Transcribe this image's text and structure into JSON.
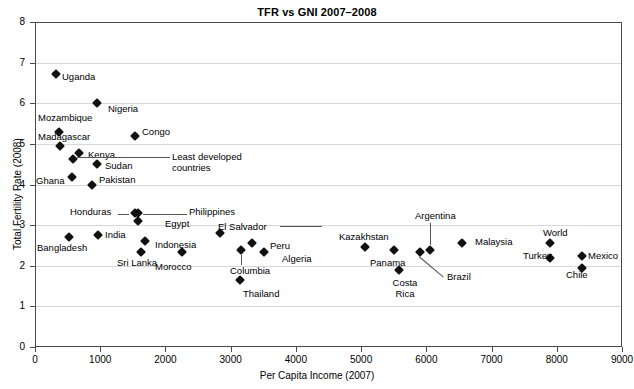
{
  "chart_data": {
    "type": "scatter",
    "title": "TFR vs GNI 2007–2008",
    "xlabel": "Per Capita Income (2007)",
    "ylabel": "Total Fertility Rate (2008)",
    "xlim": [
      0,
      9000
    ],
    "ylim": [
      0,
      8
    ],
    "xticks": [
      "0",
      "1000",
      "2000",
      "3000",
      "4000",
      "5000",
      "6000",
      "7000",
      "8000",
      "9000"
    ],
    "yticks": [
      "0",
      "1",
      "2",
      "3",
      "4",
      "5",
      "6",
      "7",
      "8"
    ],
    "grid": true,
    "legend": "none",
    "marker": "diamond",
    "marker_color": "#111111",
    "points": [
      {
        "label": "Uganda",
        "x": 320,
        "y": 6.72,
        "lx": 62,
        "ly": 72,
        "align": "right"
      },
      {
        "label": "Nigeria",
        "x": 950,
        "y": 6.0,
        "lx": 108,
        "ly": 104,
        "align": "right"
      },
      {
        "label": "Mozambique",
        "x": 370,
        "y": 5.3,
        "lx": 38,
        "ly": 113,
        "align": "above"
      },
      {
        "label": "Congo",
        "x": 1540,
        "y": 5.2,
        "lx": 142,
        "ly": 127,
        "align": "right"
      },
      {
        "label": "Madagascar",
        "x": 380,
        "y": 4.95,
        "lx": 38,
        "ly": 132,
        "align": "above"
      },
      {
        "label": "Kenya",
        "x": 680,
        "y": 4.78,
        "lx": 88,
        "ly": 150,
        "align": "right"
      },
      {
        "label": "",
        "x": 590,
        "y": 4.62,
        "lx": 0,
        "ly": 0,
        "align": "none"
      },
      {
        "label": "Sudan",
        "x": 950,
        "y": 4.5,
        "lx": 105,
        "ly": 161,
        "align": "right"
      },
      {
        "label": "Ghana",
        "x": 570,
        "y": 4.18,
        "lx": 36,
        "ly": 176,
        "align": "left"
      },
      {
        "label": "Pakistan",
        "x": 870,
        "y": 4.0,
        "lx": 99,
        "ly": 175,
        "align": "right"
      },
      {
        "label": "Philippines",
        "x": 1580,
        "y": 3.3,
        "lx": 189,
        "ly": 207,
        "align": "right-leader"
      },
      {
        "label": "Honduras",
        "x": 1530,
        "y": 3.3,
        "lx": 70,
        "ly": 207,
        "align": "left-leader"
      },
      {
        "label": "Egypt",
        "x": 1580,
        "y": 3.1,
        "lx": 165,
        "ly": 219,
        "align": "right"
      },
      {
        "label": "India",
        "x": 970,
        "y": 2.75,
        "lx": 105,
        "ly": 230,
        "align": "right"
      },
      {
        "label": "Bangladesh",
        "x": 520,
        "y": 2.7,
        "lx": 37,
        "ly": 243,
        "align": "below"
      },
      {
        "label": "Indonesia",
        "x": 1690,
        "y": 2.6,
        "lx": 155,
        "ly": 240,
        "align": "right"
      },
      {
        "label": "El Salvador",
        "x": 2840,
        "y": 2.8,
        "lx": 218,
        "ly": 222,
        "align": "above-leader"
      },
      {
        "label": "Sri Lanka",
        "x": 1620,
        "y": 2.35,
        "lx": 117,
        "ly": 258,
        "align": "below"
      },
      {
        "label": "Morocco",
        "x": 2250,
        "y": 2.35,
        "lx": 155,
        "ly": 262,
        "align": "below"
      },
      {
        "label": "Peru",
        "x": 3320,
        "y": 2.55,
        "lx": 270,
        "ly": 241,
        "align": "right"
      },
      {
        "label": "Algeria",
        "x": 3510,
        "y": 2.35,
        "lx": 282,
        "ly": 254,
        "align": "right"
      },
      {
        "label": "Columbia",
        "x": 3160,
        "y": 2.4,
        "lx": 230,
        "ly": 266,
        "align": "below-leader"
      },
      {
        "label": "Thailand",
        "x": 3140,
        "y": 1.65,
        "lx": 243,
        "ly": 289,
        "align": "below"
      },
      {
        "label": "Kazakhstan",
        "x": 5060,
        "y": 2.45,
        "lx": 339,
        "ly": 232,
        "align": "above"
      },
      {
        "label": "Panama",
        "x": 5510,
        "y": 2.4,
        "lx": 370,
        "ly": 258,
        "align": "below"
      },
      {
        "label": "Costa Rica",
        "x": 5580,
        "y": 1.9,
        "lx": 383,
        "ly": 278,
        "align": "below-two"
      },
      {
        "label": "Brazil",
        "x": 5900,
        "y": 2.35,
        "lx": 447,
        "ly": 272,
        "align": "diag-leader"
      },
      {
        "label": "Argentina",
        "x": 6060,
        "y": 2.4,
        "lx": 415,
        "ly": 211,
        "align": "above-leader"
      },
      {
        "label": "Malaysia",
        "x": 6540,
        "y": 2.55,
        "lx": 475,
        "ly": 237,
        "align": "right"
      },
      {
        "label": "World",
        "x": 7900,
        "y": 2.55,
        "lx": 543,
        "ly": 228,
        "align": "above"
      },
      {
        "label": "Turkey",
        "x": 7900,
        "y": 2.2,
        "lx": 523,
        "ly": 251,
        "align": "left"
      },
      {
        "label": "Mexico",
        "x": 8380,
        "y": 2.25,
        "lx": 588,
        "ly": 251,
        "align": "right"
      },
      {
        "label": "Chile",
        "x": 8380,
        "y": 1.95,
        "lx": 566,
        "ly": 270,
        "align": "below"
      }
    ],
    "annotations": [
      {
        "text_line1": "Least developed",
        "text_line2": "countries",
        "lx": 172,
        "ly": 152
      }
    ]
  }
}
